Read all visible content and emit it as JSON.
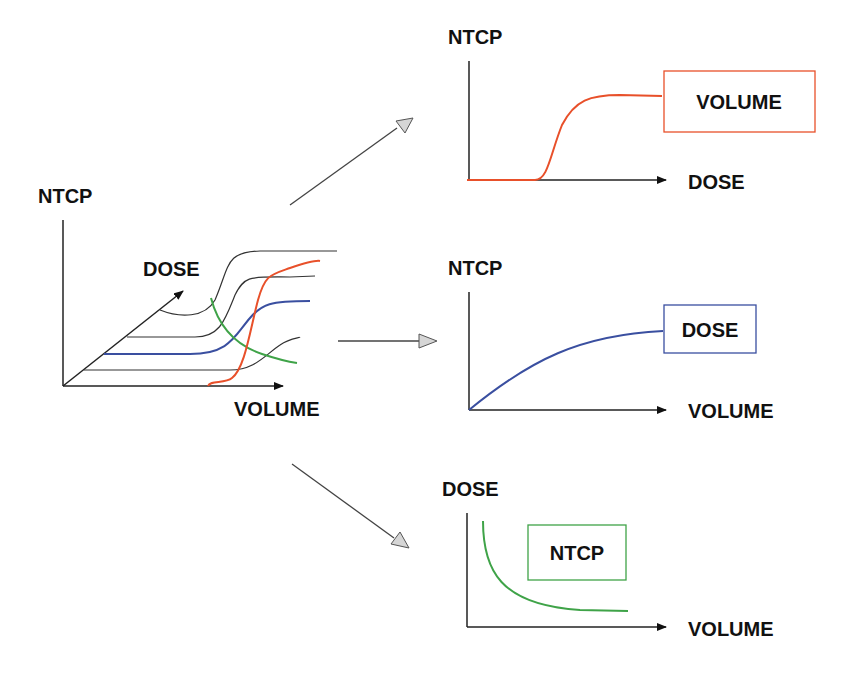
{
  "colors": {
    "axis": "#222222",
    "black_curve": "#333333",
    "red": "#e8502a",
    "blue": "#3a4fa0",
    "green": "#3fa348",
    "arrow_fill": "#d6d6d6",
    "arrow_stroke": "#555555"
  },
  "main_plot": {
    "y_label": "NTCP",
    "depth_label": "DOSE",
    "x_label": "VOLUME"
  },
  "panel_top": {
    "y_label": "NTCP",
    "x_label": "DOSE",
    "box_label": "VOLUME",
    "curve_color": "red"
  },
  "panel_middle": {
    "y_label": "NTCP",
    "x_label": "VOLUME",
    "box_label": "DOSE",
    "curve_color": "blue"
  },
  "panel_bottom": {
    "y_label": "DOSE",
    "x_label": "VOLUME",
    "box_label": "NTCP",
    "curve_color": "green"
  }
}
